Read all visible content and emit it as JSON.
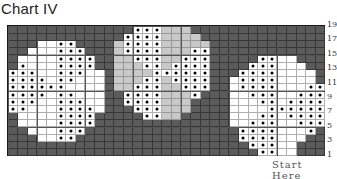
{
  "title": "Chart IV",
  "footer_text": "Start Here",
  "colors": {
    "dark": "#5b5b5b",
    "light": "#c9c9c9",
    "white": "#ffffff",
    "dot": "#000000"
  },
  "chart_data": {
    "type": "heatmap",
    "title": "Chart IV",
    "columns": 33,
    "rows": 18,
    "row_labels": [
      "1",
      "3",
      "5",
      "7",
      "9",
      "11",
      "13",
      "15",
      "17",
      "19"
    ],
    "legend": {
      "D": "dark",
      "L": "light gray",
      "W": "white",
      "o": "white with dot"
    },
    "grid": [
      "DDDDDDDDDDDDDoooLLLDDDDDDDDDDDDDD",
      "DDDDDDDDDDDDooooLLLLDDDDDDDDDDDDD",
      "DDDWWooDDDDLooooLLLLLDDDDDDDDDDDD",
      "DDWWWoooDDDLooooLLLooDDDDDDDDDDDD",
      "DWWWWooooDDLLoooLLoooDDDDDooWWDDD",
      "DoWWWooooDDLLLooLooooDDDDoooWWWDD",
      "oooWWoooWWDLLLLooooooDDDooooWWWWD",
      "ooooWooWWWDLLLooLooooDDWooooWWWWD",
      "ooooooWWWWDLLoooLLoooDDWooooWWWoo",
      "ooooWooWWWDDooooLLLoDDDWWoooWWooo",
      "oooWWoooWWDDooooLLLDDDDWWWooWoooo",
      "ooWWWooooWDDDoooLLLDDDDWWWWoooooo",
      "DWWWWooooDDDDDooLLDDDDDWWWooWoooo",
      "DWWWWooooDDDDDDDDDDDDDDWWoooWWooo",
      "DDWWWoooDDDDDDDDDDDDDDDDooooWWWoD",
      "DDDWWooDDDDDDDDDDDDDDDDDooooWWWDD",
      "DDDDDDDDDDDDDDDDDDDDDDDDDoooWWDDD",
      "DDDDDDDDDDDDDDDDDDDDDDDDDDooWWDDD"
    ]
  }
}
